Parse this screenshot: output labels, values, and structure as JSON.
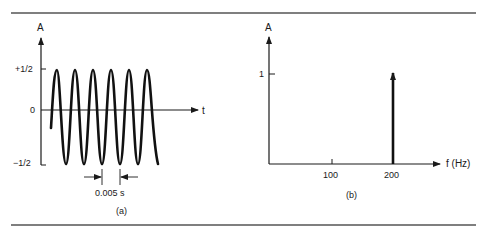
{
  "figure": {
    "panel_a": {
      "caption": "(a)",
      "y_axis_label": "A",
      "x_axis_label": "t",
      "y_ticks": [
        "+1/2",
        "0",
        "−1/2"
      ],
      "period_annotation": "0.005 s",
      "cycles_shown": 6
    },
    "panel_b": {
      "caption": "(b)",
      "y_axis_label": "A",
      "x_axis_label": "f (Hz)",
      "y_ticks": [
        "1"
      ],
      "x_ticks": [
        "100",
        "200"
      ],
      "spike": {
        "frequency": "200",
        "amplitude": "1"
      }
    },
    "colors": {
      "line": "#1a1a1a",
      "rule": "#555555",
      "background": "#ffffff"
    }
  }
}
